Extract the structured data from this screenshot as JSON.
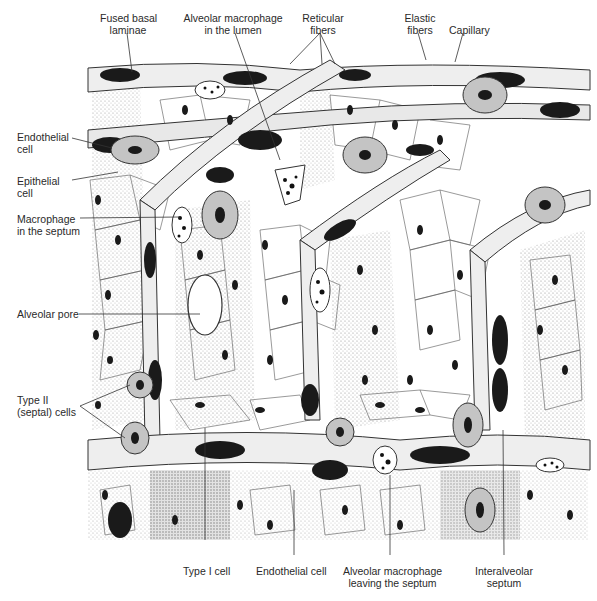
{
  "figure": {
    "colors": {
      "background": "#ffffff",
      "ink": "#1a1a1a",
      "cell_fill": "#bdbdbd",
      "stipple": "#8a8a8a"
    }
  },
  "labels": {
    "top": [
      {
        "id": "fused-basal-laminae",
        "line1": "Fused basal",
        "line2": "laminae"
      },
      {
        "id": "alveolar-macrophage-lumen",
        "line1": "Alveolar macrophage",
        "line2": "in the lumen"
      },
      {
        "id": "reticular-fibers",
        "line1": "Reticular",
        "line2": "fibers"
      },
      {
        "id": "elastic-fibers",
        "line1": "Elastic",
        "line2": "fibers"
      },
      {
        "id": "capillary",
        "line1": "Capillary",
        "line2": ""
      }
    ],
    "left": [
      {
        "id": "endothelial-cell-left",
        "line1": "Endothelial",
        "line2": "cell"
      },
      {
        "id": "epithelial-cell",
        "line1": "Epithelial",
        "line2": "cell"
      },
      {
        "id": "macrophage-septum",
        "line1": "Macrophage",
        "line2": "in the septum"
      },
      {
        "id": "alveolar-pore",
        "line1": "Alveolar pore",
        "line2": ""
      },
      {
        "id": "type-ii-cells",
        "line1": "Type II",
        "line2": "(septal) cells"
      }
    ],
    "bottom": [
      {
        "id": "type-i-cell",
        "line1": "Type I cell",
        "line2": ""
      },
      {
        "id": "endothelial-cell-bottom",
        "line1": "Endothelial cell",
        "line2": ""
      },
      {
        "id": "alveolar-macrophage-leaving",
        "line1": "Alveolar macrophage",
        "line2": "leaving the septum"
      },
      {
        "id": "interalveolar-septum",
        "line1": "Interalveolar",
        "line2": "septum"
      }
    ]
  }
}
